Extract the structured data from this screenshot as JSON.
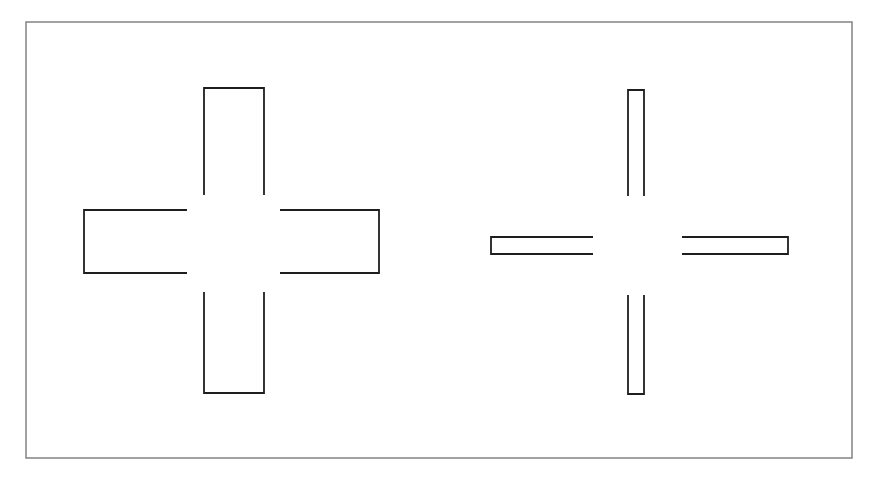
{
  "diagram": {
    "background": "#ffffff",
    "frame": {
      "x": 26,
      "y": 22,
      "width": 826,
      "height": 436,
      "stroke": "#8a8a8a",
      "stroke_width": 1.6
    },
    "stroke_color": "#1e1e1e",
    "stroke_width": 1.8,
    "crosses": [
      {
        "name": "wide-cross",
        "arms": {
          "top": {
            "x1": 204,
            "x2": 264,
            "y_outer": 88,
            "y_inner": 195
          },
          "bottom": {
            "x1": 204,
            "x2": 264,
            "y_outer": 393,
            "y_inner": 292
          },
          "left": {
            "y1": 210,
            "y2": 273,
            "x_outer": 84,
            "x_inner": 187
          },
          "right": {
            "y1": 210,
            "y2": 273,
            "x_outer": 379,
            "x_inner": 280
          }
        }
      },
      {
        "name": "thin-cross",
        "arms": {
          "top": {
            "x1": 628,
            "x2": 644,
            "y_outer": 90,
            "y_inner": 196
          },
          "bottom": {
            "x1": 628,
            "x2": 644,
            "y_outer": 394,
            "y_inner": 295
          },
          "left": {
            "y1": 237,
            "y2": 254,
            "x_outer": 491,
            "x_inner": 593
          },
          "right": {
            "y1": 237,
            "y2": 254,
            "x_outer": 788,
            "x_inner": 682
          }
        }
      }
    ]
  }
}
